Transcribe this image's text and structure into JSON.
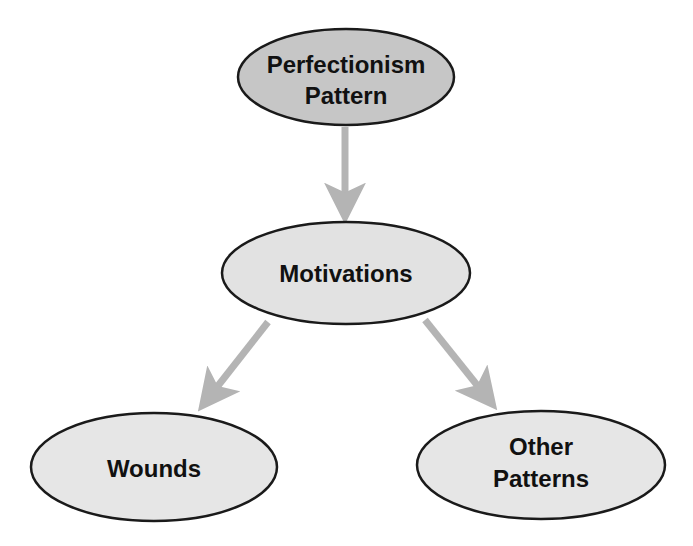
{
  "diagram": {
    "nodes": [
      {
        "id": "perfectionism",
        "lines": [
          "Perfectionism",
          "Pattern"
        ],
        "fill": "#c6c6c6"
      },
      {
        "id": "motivations",
        "lines": [
          "Motivations"
        ],
        "fill": "#e2e2e2"
      },
      {
        "id": "wounds",
        "lines": [
          "Wounds"
        ],
        "fill": "#e6e6e6"
      },
      {
        "id": "other-patterns",
        "lines": [
          "Other",
          "Patterns"
        ],
        "fill": "#e6e6e6"
      }
    ],
    "edges": [
      {
        "from": "perfectionism",
        "to": "motivations"
      },
      {
        "from": "motivations",
        "to": "wounds"
      },
      {
        "from": "motivations",
        "to": "other-patterns"
      }
    ],
    "arrow_color": "#b4b4b4",
    "stroke_color": "#1a1a1a"
  }
}
